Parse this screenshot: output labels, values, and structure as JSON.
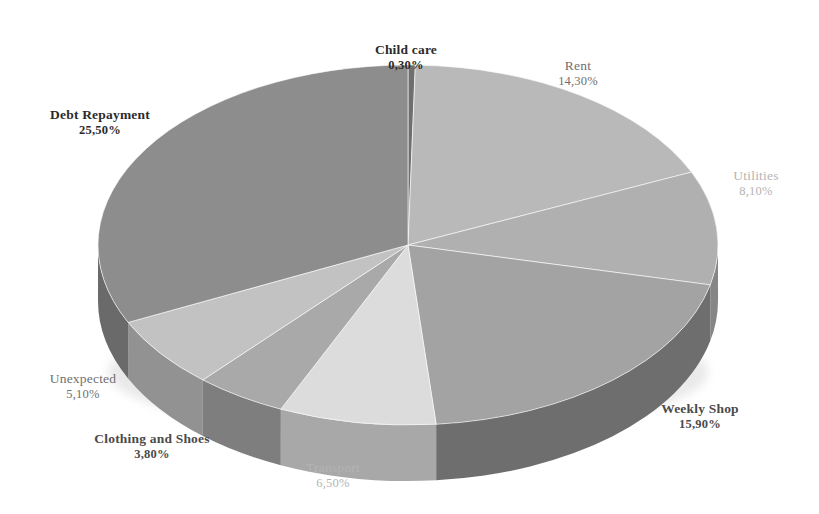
{
  "background": "#ffffff",
  "chart_data": {
    "type": "pie",
    "title": "",
    "subtitle": "",
    "xlabel": "",
    "ylabel": "",
    "legend_position": "none",
    "grid": false,
    "style": "3d-pie",
    "decimal_separator": ",",
    "value_suffix": "%",
    "start_angle_deg": 0,
    "direction": "clockwise",
    "categories": [
      "Child care",
      "Rent",
      "Utilities",
      "Weekly Shop",
      "Transport",
      "Clothing and Shoes",
      "Unexpected",
      "Debt Repayment"
    ],
    "values": [
      0.3,
      14.3,
      8.1,
      15.9,
      6.5,
      3.8,
      5.1,
      25.5
    ],
    "value_labels": [
      "0,30%",
      "14,30%",
      "8,10%",
      "15,90%",
      "6,50%",
      "3,80%",
      "5,10%",
      "25,50%"
    ],
    "slice_colors": [
      "#6f6f6f",
      "#b9b9b9",
      "#b0b0b0",
      "#a3a3a3",
      "#dcdcdc",
      "#a9a9a9",
      "#c2c2c2",
      "#8d8d8d"
    ],
    "side_colors": [
      "#4a4a4a",
      "#8e8e8e",
      "#868686",
      "#6e6e6e",
      "#a8a8a8",
      "#7e7e7e",
      "#929292",
      "#6a6a6a"
    ]
  },
  "labels": [
    {
      "name": "Child care",
      "value": "0,30%",
      "tone": "tone-dark",
      "x": 406,
      "y": 42
    },
    {
      "name": "Rent",
      "value": "14,30%",
      "tone": "tone-mid",
      "x": 578,
      "y": 58
    },
    {
      "name": "Utilities",
      "value": "8,10%",
      "tone": "tone-light",
      "x": 756,
      "y": 168
    },
    {
      "name": "Weekly Shop",
      "value": "15,90%",
      "tone": "tone-midbold",
      "x": 700,
      "y": 401
    },
    {
      "name": "Transport",
      "value": "6,50%",
      "tone": "tone-light",
      "x": 333,
      "y": 460
    },
    {
      "name": "Clothing and Shoes",
      "value": "3,80%",
      "tone": "tone-midbold",
      "x": 152,
      "y": 431
    },
    {
      "name": "Unexpected",
      "value": "5,10%",
      "tone": "tone-mid",
      "x": 83,
      "y": 371
    },
    {
      "name": "Debt Repayment",
      "value": "25,50%",
      "tone": "tone-dark",
      "x": 100,
      "y": 107
    }
  ]
}
